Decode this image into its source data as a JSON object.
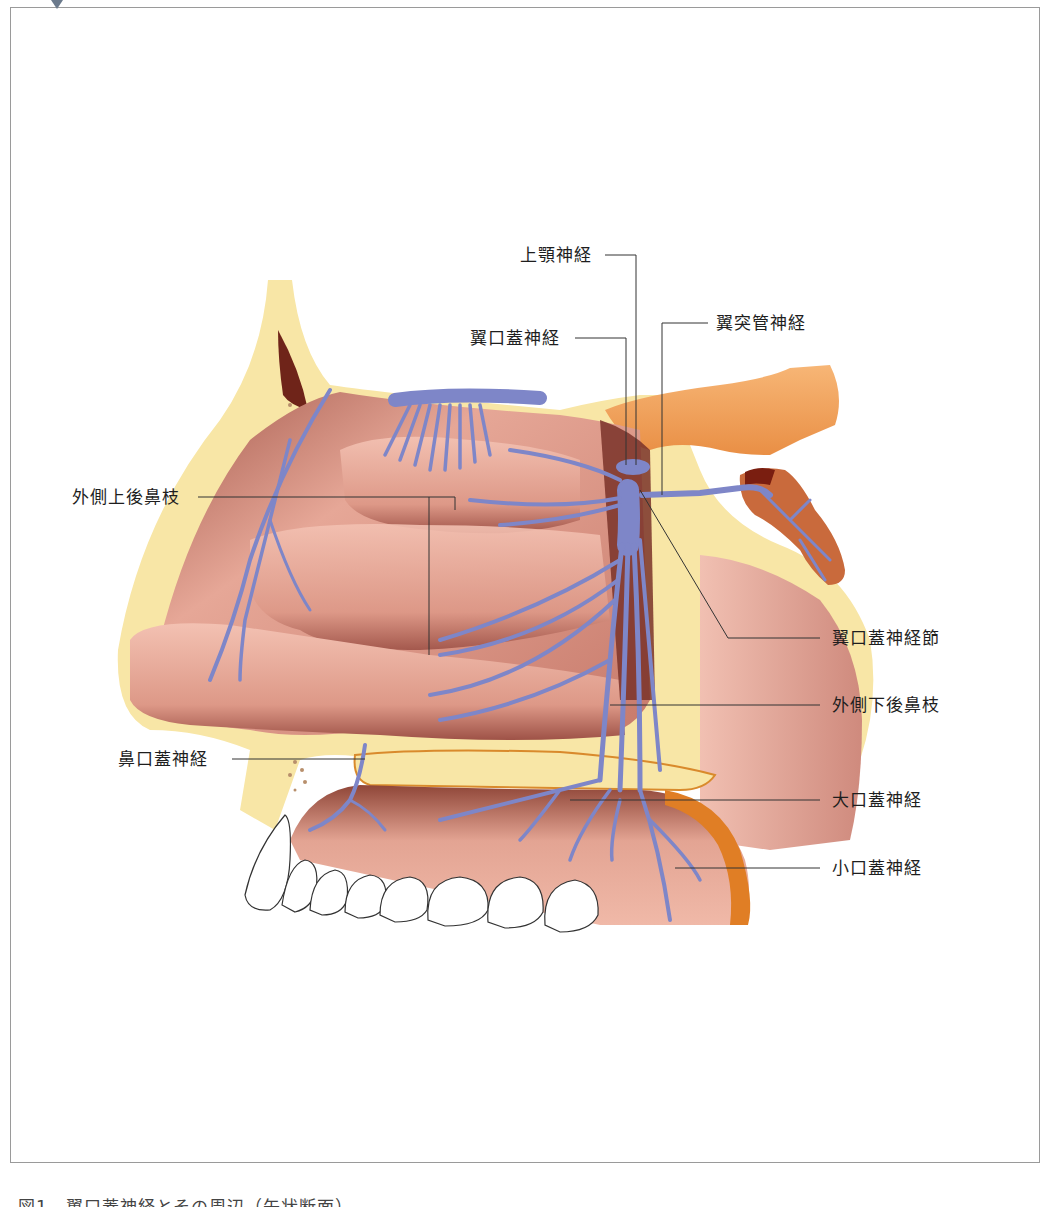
{
  "figure": {
    "title_visible": false,
    "frame_border_color": "#9a9a9a",
    "colors": {
      "nerve": "#7e86c8",
      "nerve_dark": "#5a62a8",
      "mucosa": "#e3a293",
      "mucosa_dark": "#9c4f45",
      "bone": "#f8e6a6",
      "bone_edge": "#d98a2c",
      "sphenoid": "#f2a45e",
      "palate_orange": "#e07e25",
      "teeth": "#ffffff"
    }
  },
  "labels": {
    "maxillary_nerve": "上顎神経",
    "pterygopalatine_nerve": "翼口蓋神経",
    "pterygoid_canal_nerve": "翼突管神経",
    "lateral_superior_posterior_nasal_branches": "外側上後鼻枝",
    "pterygopalatine_ganglion": "翼口蓋神経節",
    "lateral_inferior_posterior_nasal_branches": "外側下後鼻枝",
    "nasopalatine_nerve": "鼻口蓋神経",
    "greater_palatine_nerve": "大口蓋神経",
    "lesser_palatine_nerve": "小口蓋神経"
  },
  "caption": {
    "text": "図1　翼口蓋神経とその周辺（矢状断面）"
  }
}
